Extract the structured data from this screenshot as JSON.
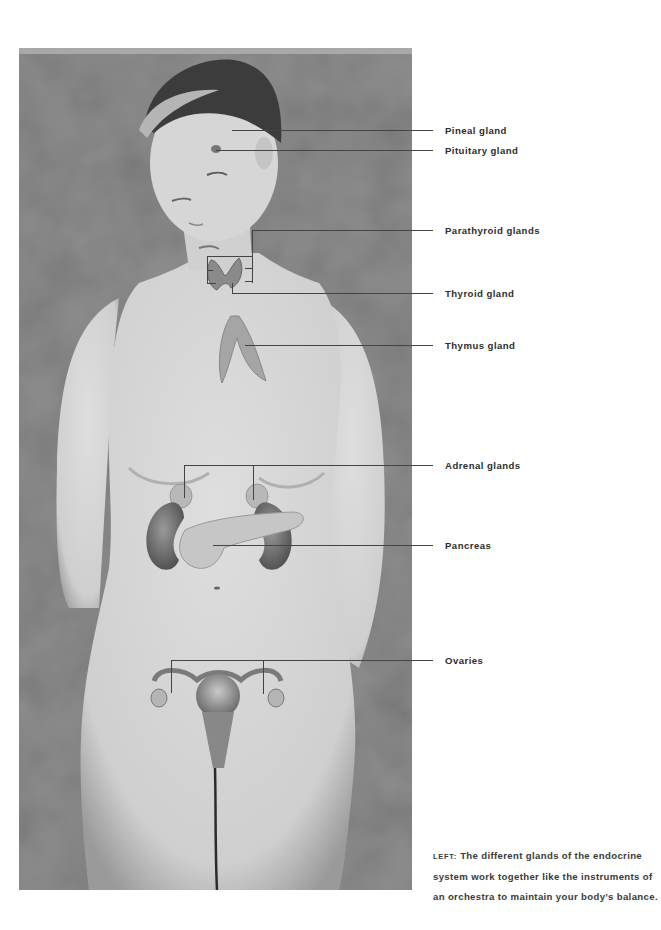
{
  "figure": {
    "labels": [
      {
        "id": "pineal",
        "text": "Pineal gland",
        "y": 131
      },
      {
        "id": "pituitary",
        "text": "Pituitary gland",
        "y": 151
      },
      {
        "id": "parathyroid",
        "text": "Parathyroid glands",
        "y": 231
      },
      {
        "id": "thyroid",
        "text": "Thyroid gland",
        "y": 294
      },
      {
        "id": "thymus",
        "text": "Thymus gland",
        "y": 346
      },
      {
        "id": "adrenal",
        "text": "Adrenal glands",
        "y": 466
      },
      {
        "id": "pancreas",
        "text": "Pancreas",
        "y": 546
      },
      {
        "id": "ovaries",
        "text": "Ovaries",
        "y": 661
      }
    ],
    "colors": {
      "leader_line": "#444444",
      "label_text": "#2d2d2d",
      "background_mottle": "#8c8c8c",
      "skin": "#d4d4d4"
    }
  },
  "caption": {
    "lead": "LEFT:",
    "text": " The different glands of the endocrine system work together like the instruments of an orchestra to maintain your body’s balance."
  }
}
